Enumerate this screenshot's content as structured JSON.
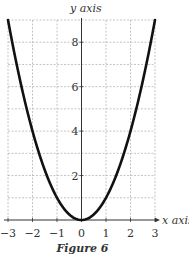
{
  "chart_data": {
    "type": "line",
    "title": "",
    "caption": "Figure 6",
    "xlabel": "x axis",
    "ylabel": "y axis",
    "xlim": [
      -3,
      3
    ],
    "ylim": [
      0,
      9
    ],
    "grid": true,
    "x_ticks": [
      -3,
      -2,
      -1,
      0,
      1,
      2,
      3
    ],
    "x_tick_labels": [
      "−3",
      "−2",
      "−1",
      "0",
      "1",
      "2",
      "3"
    ],
    "y_ticks": [
      2,
      4,
      6,
      8
    ],
    "y_tick_labels": [
      "2",
      "4",
      "6",
      "8"
    ],
    "series": [
      {
        "name": "y = x^2",
        "x": [
          -3,
          -2.5,
          -2,
          -1.5,
          -1,
          -0.5,
          0,
          0.5,
          1,
          1.5,
          2,
          2.5,
          3
        ],
        "values": [
          9,
          6.25,
          4,
          2.25,
          1,
          0.25,
          0,
          0.25,
          1,
          2.25,
          4,
          6.25,
          9
        ],
        "color": "#111111"
      }
    ]
  },
  "figure": {
    "caption": "Figure 6",
    "x_axis_label": "x axis",
    "y_axis_label": "y axis"
  }
}
